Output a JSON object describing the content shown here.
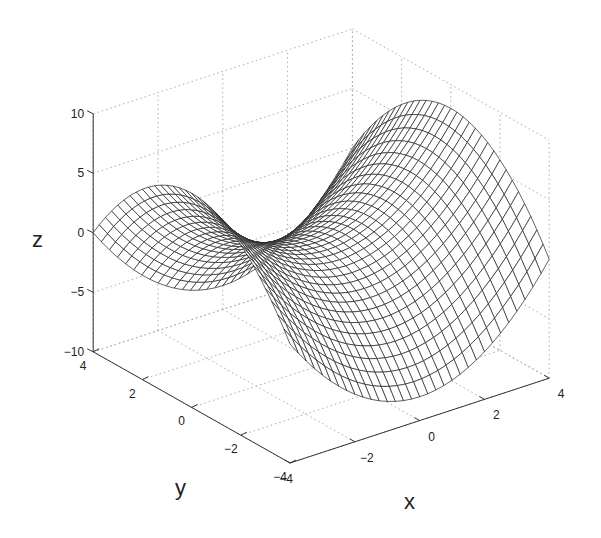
{
  "chart_data": {
    "type": "surface",
    "title": "",
    "function": "z = (x^2 - y^2) / 2",
    "xlabel": "x",
    "ylabel": "y",
    "zlabel": "z",
    "xlim": [
      -4,
      4
    ],
    "ylim": [
      -4,
      4
    ],
    "zlim": [
      -10,
      10
    ],
    "x_ticks": [
      -4,
      -2,
      0,
      2,
      4
    ],
    "y_ticks": [
      -4,
      -2,
      0,
      2,
      4
    ],
    "z_ticks": [
      -10,
      -5,
      0,
      5,
      10
    ],
    "x_tick_labels": [
      "−4",
      "−2",
      "0",
      "2",
      "4"
    ],
    "y_tick_labels": [
      "−4",
      "−2",
      "0",
      "2",
      "4"
    ],
    "z_tick_labels": [
      "−10",
      "−5",
      "0",
      "5",
      "10"
    ],
    "grid": true,
    "mesh_resolution": 33,
    "mesh_color": "#222222",
    "face_color": "#ffffff",
    "legend": null
  }
}
